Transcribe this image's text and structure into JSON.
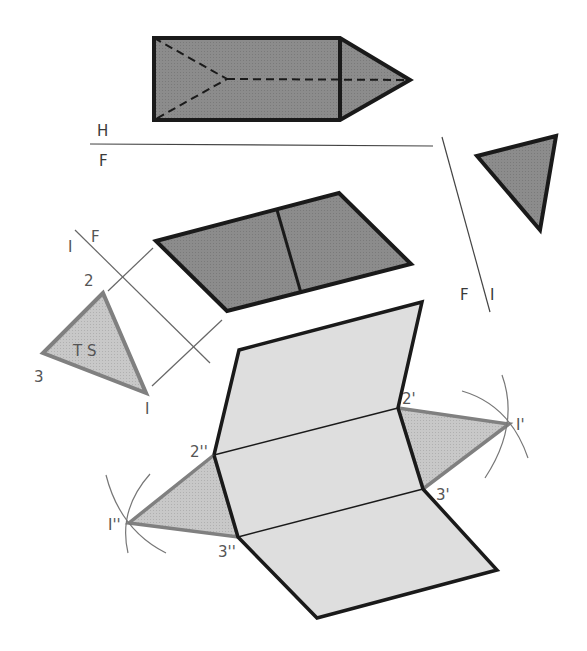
{
  "colors": {
    "dark_fill": "#8a8a8a",
    "light_fill": "#dcdcdc",
    "triangle_fill": "#c4c4c4",
    "stroke_dark": "#1a1a1a",
    "stroke_gray": "#7a7a7a",
    "thin_line": "#555555"
  },
  "top_view": {
    "ref_label_upper": "H",
    "ref_label_lower": "F"
  },
  "front_aux_line": {
    "label_left": "F",
    "label_right": "I"
  },
  "true_shape": {
    "fold_label_1": "I",
    "fold_label_F": "F",
    "vertex_1": "I",
    "vertex_2": "2",
    "vertex_3": "3",
    "ts_label": "T S"
  },
  "development": {
    "label_1p": "I'",
    "label_2p": "2'",
    "label_3p": "3'",
    "label_1pp": "I''",
    "label_2pp": "2''",
    "label_3pp": "3''"
  }
}
